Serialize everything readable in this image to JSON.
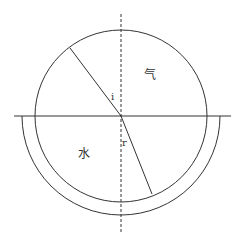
{
  "diagram": {
    "type": "refraction-semicircle",
    "labels": {
      "air": "气",
      "water": "水",
      "incidence_angle": "i",
      "refraction_angle": "r"
    },
    "colors": {
      "stroke": "#333333",
      "background": "#ffffff"
    },
    "geometry": {
      "center": [
        121,
        116
      ],
      "circle_radius": 86,
      "outer_arc_radius": 99,
      "interface_line": {
        "x1": 14,
        "x2": 231,
        "y": 116
      },
      "normal_line": {
        "x": 121,
        "y1": 14,
        "y2": 232
      },
      "incident_ray": {
        "from": [
          70,
          48
        ],
        "to": [
          121,
          116
        ]
      },
      "refracted_ray": {
        "from": [
          121,
          116
        ],
        "to": [
          152,
          194
        ]
      }
    }
  }
}
